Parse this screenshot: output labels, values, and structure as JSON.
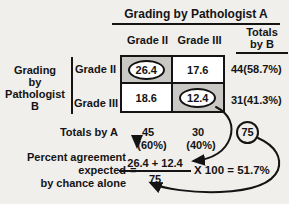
{
  "colors": {
    "background": "#f0efec",
    "shaded_cell": "#c9c8c4",
    "line": "#141414"
  },
  "figure": {
    "title": "Grading by Pathologist A",
    "table": {
      "col_headers": [
        "Grade II",
        "Grade III"
      ],
      "totals_col_header_lines": [
        "Totals",
        "by B"
      ],
      "row_group_label_lines": [
        "Grading",
        "by",
        "Pathologist",
        "B"
      ],
      "row_headers": [
        "Grade II",
        "Grade III"
      ],
      "cells": [
        [
          "26.4",
          "17.6"
        ],
        [
          "18.6",
          "12.4"
        ]
      ],
      "circled_cells": [
        "26.4",
        "12.4"
      ],
      "row_totals": [
        "44(58.7%)",
        "31(41.3%)"
      ],
      "totals_row_label": "Totals by A",
      "col_totals": [
        {
          "value": "45",
          "pct": "(60%)"
        },
        {
          "value": "30",
          "pct": "(40%)"
        }
      ],
      "grand_total": "75"
    },
    "formula": {
      "label_lines": [
        "Percent agreement",
        "expected",
        "by chance alone"
      ],
      "equals": "=",
      "numerator": "26.4 + 12.4",
      "denominator": "75",
      "suffix": "X 100 = 51.7%"
    }
  }
}
